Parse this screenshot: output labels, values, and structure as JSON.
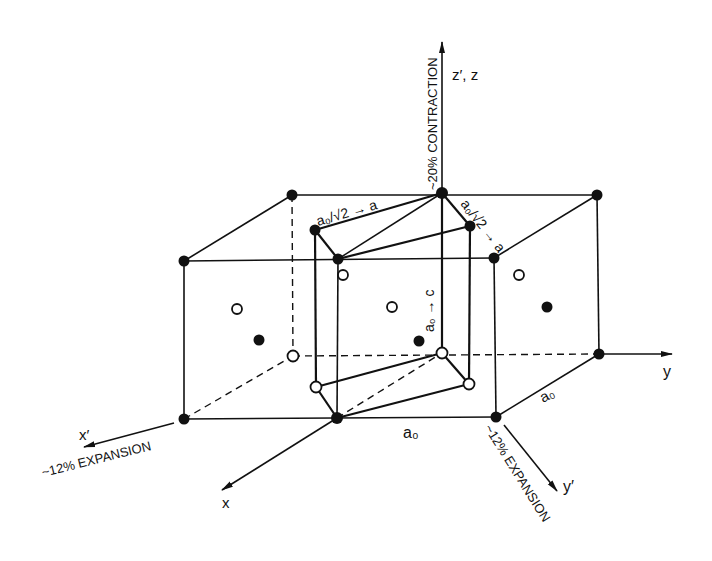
{
  "diagram": {
    "type": "crystal-lattice-transformation",
    "axes": {
      "z": {
        "label": "z′, z",
        "annotation": "~20% CONTRACTION"
      },
      "y": {
        "label": "y"
      },
      "x": {
        "label": "x"
      },
      "x_prime": {
        "label": "x′",
        "annotation": "~12% EXPANSION"
      },
      "y_prime": {
        "label": "y′",
        "annotation": "~12% EXPANSION"
      }
    },
    "labels": {
      "edge_front": "a₀",
      "edge_side": "a₀",
      "tet_a1": "a₀/√2 → a",
      "tet_a2": "a₀/√2 → a",
      "tet_c": "a₀ → c"
    },
    "legend": {
      "solid": "lattice atom (filled)",
      "open": "lattice atom (open)"
    },
    "colors": {
      "line": "#111111",
      "background": "#ffffff"
    }
  }
}
